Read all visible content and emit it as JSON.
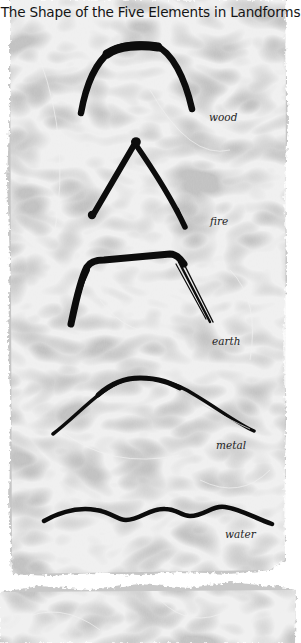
{
  "page": {
    "title": "The Shape of the Five Elements in Landforms"
  },
  "colors": {
    "paper": "#c4c4c4",
    "paper_light": "#e2e2e2",
    "ink": "#0c0c0c",
    "background": "#ffffff",
    "title_text": "#141414"
  },
  "elements": [
    {
      "id": "wood",
      "label": "wood",
      "shape": "rounded arch"
    },
    {
      "id": "fire",
      "label": "fire",
      "shape": "sharp peak"
    },
    {
      "id": "earth",
      "label": "earth",
      "shape": "flat-topped plateau"
    },
    {
      "id": "metal",
      "label": "metal",
      "shape": "gentle round dome"
    },
    {
      "id": "water",
      "label": "water",
      "shape": "undulating wave"
    }
  ]
}
